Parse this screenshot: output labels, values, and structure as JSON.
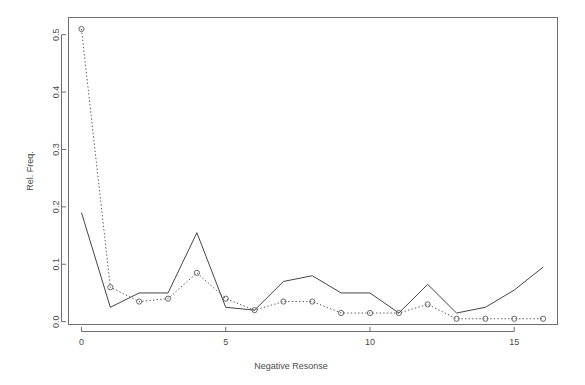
{
  "chart_data": {
    "type": "line",
    "title": "",
    "subtitle": "",
    "xlabel": "Negative Resonse",
    "ylabel": "Rel. Freq.",
    "xlim": [
      -0.45,
      16.5
    ],
    "ylim": [
      -0.005,
      0.53
    ],
    "xticks": [
      0,
      5,
      10,
      15
    ],
    "xtick_labels": [
      "0",
      "5",
      "10",
      "15"
    ],
    "yticks": [
      0.0,
      0.1,
      0.2,
      0.3,
      0.4,
      0.5
    ],
    "ytick_labels": [
      "0.0",
      "0.1",
      "0.2",
      "0.3",
      "0.4",
      "0.5"
    ],
    "grid": false,
    "legend": null,
    "box": true,
    "x": [
      0,
      1,
      2,
      3,
      4,
      5,
      6,
      7,
      8,
      9,
      10,
      11,
      12,
      13,
      14,
      15,
      16
    ],
    "series": [
      {
        "name": "observed",
        "linestyle": "solid",
        "marker": "none",
        "color": "#454545",
        "values": [
          0.19,
          0.025,
          0.05,
          0.05,
          0.155,
          0.025,
          0.02,
          0.07,
          0.08,
          0.05,
          0.05,
          0.015,
          0.065,
          0.015,
          0.025,
          0.055,
          0.095
        ]
      },
      {
        "name": "fitted",
        "linestyle": "dotted",
        "marker": "circle",
        "color": "#5a5a5a",
        "values": [
          0.51,
          0.06,
          0.035,
          0.04,
          0.085,
          0.04,
          0.02,
          0.035,
          0.035,
          0.015,
          0.015,
          0.015,
          0.03,
          0.005,
          0.005,
          0.005,
          0.005
        ]
      }
    ]
  },
  "figure": {
    "background_color": "#ffffff",
    "axis_color": "#6e6e6e",
    "text_color": "#4a4a4a"
  }
}
